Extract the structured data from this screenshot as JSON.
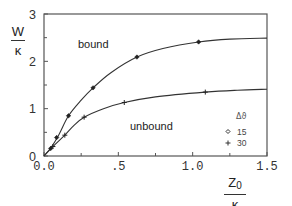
{
  "chart_data": {
    "type": "line",
    "title": "",
    "xlabel": "Z0 / κ",
    "ylabel": "W / κ",
    "xlim": [
      0,
      1.5
    ],
    "ylim": [
      0,
      3
    ],
    "grid": false,
    "x_ticks": [
      0.0,
      0.5,
      1.0,
      1.5
    ],
    "x_tick_labels": [
      "0.0",
      ".5",
      "1.0",
      "1.5"
    ],
    "x_minor_ticks": [
      0.25,
      0.75,
      1.25
    ],
    "y_ticks": [
      0,
      1,
      2,
      3
    ],
    "y_tick_labels": [
      "0",
      "1",
      "2",
      "3"
    ],
    "y_minor_ticks": [
      0.5,
      1.5,
      2.5
    ],
    "legend": {
      "title": "Δϑ",
      "position": "lower right inside",
      "entries": [
        {
          "marker": "diamond",
          "label": "15"
        },
        {
          "marker": "plus",
          "label": "30"
        }
      ]
    },
    "annotations": [
      {
        "text": "bound",
        "x": 0.34,
        "y": 2.45
      },
      {
        "text": "unbound",
        "x": 0.7,
        "y": 0.58
      }
    ],
    "series": [
      {
        "name": "bound",
        "marker": "diamond",
        "legend_ref": "15",
        "points": [
          [
            0.045,
            0.16
          ],
          [
            0.085,
            0.39
          ],
          [
            0.165,
            0.85
          ],
          [
            0.33,
            1.44
          ],
          [
            0.625,
            2.09
          ],
          [
            1.04,
            2.41
          ]
        ],
        "curve": [
          [
            0,
            0
          ],
          [
            0.05,
            0.19
          ],
          [
            0.1,
            0.45
          ],
          [
            0.165,
            0.85
          ],
          [
            0.25,
            1.18
          ],
          [
            0.33,
            1.44
          ],
          [
            0.45,
            1.76
          ],
          [
            0.625,
            2.09
          ],
          [
            0.8,
            2.27
          ],
          [
            1.04,
            2.41
          ],
          [
            1.25,
            2.47
          ],
          [
            1.5,
            2.49
          ]
        ]
      },
      {
        "name": "unbound",
        "marker": "plus",
        "legend_ref": "30",
        "points": [
          [
            0.06,
            0.2
          ],
          [
            0.14,
            0.44
          ],
          [
            0.27,
            0.82
          ],
          [
            0.54,
            1.13
          ],
          [
            1.085,
            1.35
          ]
        ],
        "curve": [
          [
            0,
            0
          ],
          [
            0.06,
            0.2
          ],
          [
            0.14,
            0.44
          ],
          [
            0.2,
            0.64
          ],
          [
            0.27,
            0.82
          ],
          [
            0.4,
            1.0
          ],
          [
            0.54,
            1.13
          ],
          [
            0.75,
            1.25
          ],
          [
            1.085,
            1.35
          ],
          [
            1.3,
            1.39
          ],
          [
            1.5,
            1.41
          ]
        ]
      }
    ]
  },
  "axes": {
    "y_label_top": "W",
    "y_label_bottom": "κ",
    "x_label_top": "Z",
    "x_label_sub": "0",
    "x_label_bottom": "κ"
  },
  "labels": {
    "bound": "bound",
    "unbound": "unbound",
    "legend_title": "Δϑ",
    "legend_15": "15",
    "legend_30": "30"
  }
}
